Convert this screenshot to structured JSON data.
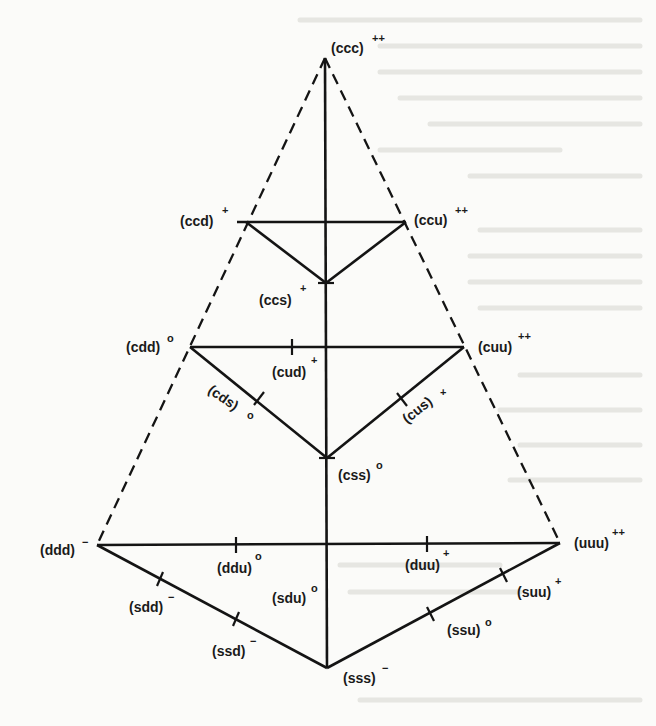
{
  "diagram": {
    "title": "",
    "colors": {
      "line": "#141414",
      "background": "#fbfbf9",
      "bleed_through": "#e6e6e2"
    },
    "nodes": [
      {
        "id": "ccc",
        "label": "(ccc)",
        "charge": "++",
        "x": 325,
        "y": 58
      },
      {
        "id": "ccd",
        "label": "(ccd)",
        "charge": "+",
        "x": 246,
        "y": 222
      },
      {
        "id": "ccu",
        "label": "(ccu)",
        "charge": "++",
        "x": 406,
        "y": 222
      },
      {
        "id": "ccs",
        "label": "(ccs)",
        "charge": "+",
        "x": 326,
        "y": 283
      },
      {
        "id": "cdd",
        "label": "(cdd)",
        "charge": "o",
        "x": 190,
        "y": 347
      },
      {
        "id": "cud",
        "label": "(cud)",
        "charge": "+",
        "x": 292,
        "y": 347
      },
      {
        "id": "cuu",
        "label": "(cuu)",
        "charge": "++",
        "x": 464,
        "y": 347
      },
      {
        "id": "cds",
        "label": "(cds)",
        "charge": "o",
        "x": 258,
        "y": 402
      },
      {
        "id": "cus",
        "label": "(cus)",
        "charge": "+",
        "x": 400,
        "y": 397
      },
      {
        "id": "css",
        "label": "(css)",
        "charge": "o",
        "x": 327,
        "y": 458
      },
      {
        "id": "ddd",
        "label": "(ddd)",
        "charge": "-",
        "x": 97,
        "y": 545
      },
      {
        "id": "ddu",
        "label": "(ddu)",
        "charge": "o",
        "x": 236,
        "y": 545
      },
      {
        "id": "duu",
        "label": "(duu)",
        "charge": "+",
        "x": 427,
        "y": 544
      },
      {
        "id": "uuu",
        "label": "(uuu)",
        "charge": "++",
        "x": 560,
        "y": 543
      },
      {
        "id": "sdd",
        "label": "(sdd)",
        "charge": "-",
        "x": 160,
        "y": 583
      },
      {
        "id": "sdu",
        "label": "(sdu)",
        "charge": "o",
        "x": 327,
        "y": 606
      },
      {
        "id": "suu",
        "label": "(suu)",
        "charge": "+",
        "x": 503,
        "y": 578
      },
      {
        "id": "ssd",
        "label": "(ssd)",
        "charge": "-",
        "x": 235,
        "y": 620
      },
      {
        "id": "ssu",
        "label": "(ssu)",
        "charge": "o",
        "x": 429,
        "y": 614
      },
      {
        "id": "sss",
        "label": "(sss)",
        "charge": "-",
        "x": 327,
        "y": 668
      }
    ],
    "labels": {
      "ccc": {
        "text": "(ccc)",
        "sup": "++"
      },
      "ccd": {
        "text": "(ccd)",
        "sup": "+"
      },
      "ccu": {
        "text": "(ccu)",
        "sup": "++"
      },
      "ccs": {
        "text": "(ccs)",
        "sup": "+"
      },
      "cdd": {
        "text": "(cdd)",
        "sup": "o"
      },
      "cud": {
        "text": "(cud)",
        "sup": "+"
      },
      "cuu": {
        "text": "(cuu)",
        "sup": "++"
      },
      "cds": {
        "text": "(cds)",
        "sup": "o"
      },
      "cus": {
        "text": "(cus)",
        "sup": "+"
      },
      "css": {
        "text": "(css)",
        "sup": "o"
      },
      "ddd": {
        "text": "(ddd)",
        "sup": "−"
      },
      "ddu": {
        "text": "(ddu)",
        "sup": "o"
      },
      "duu": {
        "text": "(duu)",
        "sup": "+"
      },
      "uuu": {
        "text": "(uuu)",
        "sup": "++"
      },
      "sdd": {
        "text": "(sdd)",
        "sup": "−"
      },
      "sdu": {
        "text": "(sdu)",
        "sup": "o"
      },
      "suu": {
        "text": "(suu)",
        "sup": "+"
      },
      "ssd": {
        "text": "(ssd)",
        "sup": "−"
      },
      "ssu": {
        "text": "(ssu)",
        "sup": "o"
      },
      "sss": {
        "text": "(sss)",
        "sup": "−"
      }
    },
    "edges_solid": [
      [
        "ccc",
        "sss"
      ],
      [
        "ccd",
        "ccu"
      ],
      [
        "ccd",
        "ccs"
      ],
      [
        "ccu",
        "ccs"
      ],
      [
        "cdd",
        "cuu"
      ],
      [
        "cdd",
        "css"
      ],
      [
        "cuu",
        "css"
      ],
      [
        "ddd",
        "uuu"
      ],
      [
        "ddd",
        "sss"
      ],
      [
        "uuu",
        "sss"
      ]
    ],
    "edges_dashed": [
      [
        "ccc",
        "ddd"
      ],
      [
        "ccc",
        "uuu"
      ]
    ]
  }
}
